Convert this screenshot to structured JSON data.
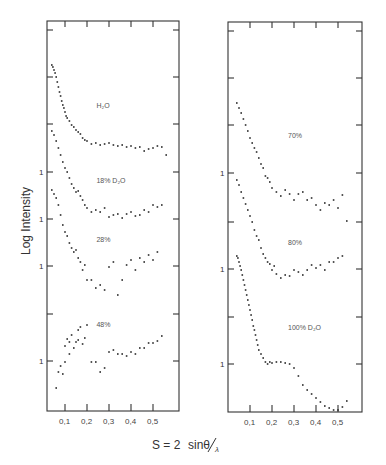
{
  "chart_data": [
    {
      "type": "scatter",
      "panel": "left",
      "title": "",
      "xlabel": "S = 2 sinθ/λ",
      "ylabel": "Log Intensity",
      "xlim": [
        0.0,
        0.61
      ],
      "x_ticks": [
        "0.1",
        "0.2",
        "0.3",
        "0.4",
        "0.5"
      ],
      "y_tick_labels": [
        "",
        "",
        "",
        "1",
        "1",
        "1",
        "",
        "1"
      ],
      "grid": false,
      "note": "y values are relative log-intensity positions in pixels from panel top (curves offset vertically)",
      "series": [
        {
          "name": "H2O",
          "label": "H₂O",
          "label_pos": [
            0.27,
            108
          ],
          "x": [
            0.04,
            0.045,
            0.05,
            0.055,
            0.06,
            0.065,
            0.07,
            0.075,
            0.08,
            0.085,
            0.09,
            0.095,
            0.1,
            0.105,
            0.11,
            0.12,
            0.13,
            0.14,
            0.15,
            0.16,
            0.17,
            0.18,
            0.19,
            0.2,
            0.22,
            0.24,
            0.26,
            0.28,
            0.3,
            0.32,
            0.34,
            0.36,
            0.38,
            0.4,
            0.42,
            0.44,
            0.46,
            0.48,
            0.5,
            0.52,
            0.54,
            0.56
          ],
          "y": [
            65,
            67,
            70,
            73,
            77,
            82,
            87,
            92,
            96,
            101,
            105,
            108,
            112,
            116,
            118,
            121,
            125,
            127,
            130,
            132,
            134,
            138,
            140,
            141,
            144,
            143,
            145,
            144,
            143,
            145,
            146,
            145,
            147,
            146,
            148,
            147,
            151,
            149,
            148,
            146,
            147,
            155
          ]
        },
        {
          "name": "18% D2O",
          "label": "18% D₂O",
          "label_pos": [
            0.27,
            183
          ],
          "x": [
            0.04,
            0.05,
            0.06,
            0.07,
            0.08,
            0.09,
            0.1,
            0.11,
            0.12,
            0.13,
            0.14,
            0.15,
            0.16,
            0.17,
            0.18,
            0.19,
            0.2,
            0.22,
            0.24,
            0.26,
            0.28,
            0.3,
            0.32,
            0.34,
            0.36,
            0.38,
            0.4,
            0.42,
            0.44,
            0.46,
            0.48,
            0.5,
            0.52,
            0.54
          ],
          "y": [
            131,
            135,
            141,
            148,
            155,
            162,
            168,
            172,
            178,
            184,
            188,
            192,
            191,
            196,
            200,
            205,
            208,
            212,
            210,
            212,
            208,
            217,
            215,
            214,
            218,
            214,
            212,
            216,
            215,
            210,
            212,
            205,
            207,
            205
          ]
        },
        {
          "name": "28%",
          "label": "28%",
          "label_pos": [
            0.27,
            242
          ],
          "x": [
            0.04,
            0.05,
            0.06,
            0.07,
            0.08,
            0.09,
            0.1,
            0.11,
            0.12,
            0.13,
            0.14,
            0.15,
            0.16,
            0.17,
            0.18,
            0.19,
            0.2,
            0.22,
            0.24,
            0.26,
            0.28,
            0.3,
            0.32,
            0.34,
            0.36,
            0.38,
            0.4,
            0.42,
            0.44,
            0.46,
            0.48,
            0.5,
            0.52
          ],
          "y": [
            190,
            194,
            198,
            205,
            215,
            225,
            232,
            236,
            243,
            248,
            252,
            250,
            258,
            262,
            270,
            265,
            280,
            280,
            288,
            285,
            290,
            267,
            262,
            295,
            280,
            265,
            260,
            270,
            258,
            262,
            255,
            260,
            252
          ]
        },
        {
          "name": "48%",
          "label": "48%",
          "label_pos": [
            0.27,
            327
          ],
          "x": [
            0.06,
            0.07,
            0.08,
            0.09,
            0.1,
            0.1,
            0.11,
            0.12,
            0.12,
            0.13,
            0.14,
            0.15,
            0.16,
            0.16,
            0.17,
            0.18,
            0.19,
            0.2,
            0.22,
            0.24,
            0.26,
            0.28,
            0.3,
            0.32,
            0.34,
            0.36,
            0.38,
            0.4,
            0.42,
            0.44,
            0.46,
            0.48,
            0.5,
            0.52,
            0.54
          ],
          "y": [
            388,
            372,
            366,
            374,
            362,
            346,
            339,
            354,
            342,
            335,
            348,
            342,
            330,
            340,
            327,
            344,
            338,
            325,
            362,
            362,
            372,
            368,
            352,
            350,
            354,
            354,
            356,
            352,
            354,
            348,
            348,
            343,
            343,
            341,
            336
          ]
        }
      ]
    },
    {
      "type": "scatter",
      "panel": "right",
      "title": "",
      "xlabel": "S = 2 sinθ/λ",
      "ylabel": "",
      "xlim": [
        0.0,
        0.61
      ],
      "x_ticks": [
        "0.1",
        "0.2",
        "0.3",
        "0.4",
        "0.5"
      ],
      "y_tick_labels": [
        "",
        "",
        "",
        "1",
        "",
        "1",
        "",
        "1"
      ],
      "grid": false,
      "series": [
        {
          "name": "70%",
          "label": "70%",
          "label_pos": [
            0.3,
            138
          ],
          "x": [
            0.04,
            0.05,
            0.06,
            0.07,
            0.08,
            0.09,
            0.1,
            0.11,
            0.12,
            0.13,
            0.14,
            0.15,
            0.16,
            0.17,
            0.18,
            0.19,
            0.2,
            0.22,
            0.24,
            0.26,
            0.28,
            0.3,
            0.32,
            0.34,
            0.36,
            0.38,
            0.4,
            0.42,
            0.44,
            0.46,
            0.48,
            0.5,
            0.52,
            0.54
          ],
          "y": [
            103,
            108,
            113,
            119,
            125,
            131,
            138,
            143,
            148,
            152,
            158,
            164,
            168,
            176,
            178,
            182,
            188,
            192,
            196,
            190,
            194,
            200,
            194,
            192,
            200,
            198,
            205,
            210,
            203,
            205,
            200,
            208,
            195,
            221
          ]
        },
        {
          "name": "80%",
          "label": "80%",
          "label_pos": [
            0.3,
            245
          ],
          "x": [
            0.04,
            0.05,
            0.06,
            0.07,
            0.08,
            0.09,
            0.1,
            0.11,
            0.12,
            0.13,
            0.14,
            0.15,
            0.16,
            0.17,
            0.18,
            0.19,
            0.2,
            0.21,
            0.22,
            0.24,
            0.26,
            0.28,
            0.3,
            0.32,
            0.34,
            0.36,
            0.38,
            0.4,
            0.42,
            0.44,
            0.46,
            0.48,
            0.5,
            0.52
          ],
          "y": [
            180,
            185,
            192,
            198,
            204,
            210,
            216,
            222,
            230,
            236,
            240,
            248,
            254,
            258,
            262,
            264,
            270,
            266,
            274,
            278,
            275,
            276,
            270,
            272,
            275,
            270,
            265,
            268,
            265,
            270,
            262,
            262,
            258,
            256
          ]
        },
        {
          "name": "100% D2O",
          "label": "100% D₂O",
          "label_pos": [
            0.3,
            330
          ],
          "x": [
            0.04,
            0.045,
            0.05,
            0.055,
            0.06,
            0.065,
            0.07,
            0.075,
            0.08,
            0.085,
            0.09,
            0.095,
            0.1,
            0.105,
            0.11,
            0.115,
            0.12,
            0.125,
            0.13,
            0.135,
            0.14,
            0.15,
            0.16,
            0.17,
            0.18,
            0.19,
            0.2,
            0.22,
            0.24,
            0.26,
            0.28,
            0.3,
            0.32,
            0.34,
            0.36,
            0.38,
            0.4,
            0.42,
            0.44,
            0.46,
            0.48,
            0.5,
            0.52,
            0.54
          ],
          "y": [
            256,
            258,
            262,
            266,
            270,
            275,
            280,
            285,
            290,
            295,
            300,
            305,
            310,
            315,
            320,
            326,
            330,
            335,
            340,
            345,
            350,
            354,
            358,
            362,
            364,
            362,
            363,
            362,
            362,
            363,
            364,
            368,
            376,
            385,
            390,
            394,
            398,
            402,
            406,
            408,
            410,
            410,
            407,
            401
          ]
        }
      ]
    }
  ],
  "figure": {
    "ylabel": "Log Intensity",
    "xlabel_main": "S = 2",
    "xlabel_frac_num": "sinθ",
    "xlabel_frac_den": "λ",
    "y_unit_label": "1"
  }
}
